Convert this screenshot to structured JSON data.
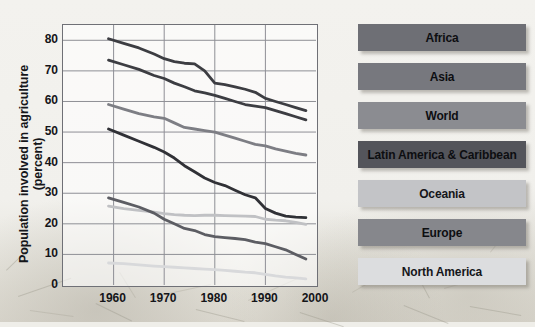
{
  "chart_data": {
    "type": "line",
    "title": "",
    "xlabel": "",
    "ylabel": "Population involved in agriculture (percent)",
    "xlim": [
      1950,
      2000
    ],
    "ylim": [
      0,
      85
    ],
    "yticks": [
      0,
      10,
      20,
      30,
      40,
      50,
      60,
      70,
      80
    ],
    "xticks": [
      1960,
      1970,
      1980,
      1990,
      2000
    ],
    "grid": true,
    "legend_position": "right",
    "x": [
      1959,
      1962,
      1965,
      1968,
      1970,
      1972,
      1974,
      1976,
      1978,
      1980,
      1982,
      1984,
      1986,
      1988,
      1990,
      1992,
      1994,
      1996,
      1998
    ],
    "series": [
      {
        "name": "Africa",
        "color": "#3c3d42",
        "values": [
          80.5,
          79.0,
          77.5,
          75.5,
          74.0,
          73.0,
          72.5,
          72.3,
          70.0,
          66.0,
          65.5,
          64.8,
          64.0,
          63.0,
          61.0,
          60.0,
          59.0,
          58.0,
          57.0
        ]
      },
      {
        "name": "Asia",
        "color": "#3c3d42",
        "values": [
          73.5,
          72.0,
          70.5,
          68.5,
          67.5,
          66.0,
          64.8,
          63.5,
          62.8,
          62.0,
          61.0,
          60.0,
          59.0,
          58.5,
          58.0,
          57.0,
          56.0,
          55.0,
          54.0
        ]
      },
      {
        "name": "World",
        "color": "#7d7e84",
        "values": [
          59.0,
          57.5,
          56.0,
          55.0,
          54.5,
          53.0,
          51.5,
          51.0,
          50.5,
          50.0,
          49.0,
          48.0,
          47.0,
          46.0,
          45.5,
          44.5,
          43.8,
          43.0,
          42.5
        ]
      },
      {
        "name": "Latin America & Caribbean",
        "color": "#303136",
        "values": [
          51.0,
          49.0,
          47.0,
          45.0,
          43.5,
          41.5,
          39.0,
          37.0,
          35.0,
          33.5,
          32.5,
          31.0,
          29.5,
          28.5,
          25.0,
          23.5,
          22.5,
          22.2,
          22.0
        ]
      },
      {
        "name": "Oceania",
        "color": "#c0c1c4",
        "values": [
          25.8,
          25.0,
          24.4,
          23.8,
          23.3,
          23.0,
          22.8,
          22.7,
          22.8,
          22.8,
          22.7,
          22.6,
          22.5,
          22.4,
          21.5,
          21.2,
          21.0,
          20.5,
          19.8
        ]
      },
      {
        "name": "Europe",
        "color": "#5c5d63",
        "values": [
          28.5,
          27.0,
          25.5,
          23.5,
          21.5,
          20.0,
          18.5,
          17.8,
          16.5,
          15.8,
          15.5,
          15.2,
          14.8,
          14.0,
          13.5,
          12.5,
          11.5,
          10.0,
          8.5
        ]
      },
      {
        "name": "North America",
        "color": "#d8d9db",
        "values": [
          7.2,
          7.0,
          6.6,
          6.2,
          6.0,
          5.8,
          5.6,
          5.4,
          5.2,
          5.0,
          4.8,
          4.5,
          4.2,
          4.0,
          3.5,
          3.0,
          2.6,
          2.3,
          2.0
        ]
      }
    ]
  },
  "legend": {
    "items": [
      {
        "label": "Africa",
        "swatch": "#6e6f75",
        "light": false
      },
      {
        "label": "Asia",
        "swatch": "#77787e",
        "light": false
      },
      {
        "label": "World",
        "swatch": "#8b8c91",
        "light": false
      },
      {
        "label": "Latin America & Caribbean",
        "swatch": "#54555b",
        "light": false
      },
      {
        "label": "Oceania",
        "swatch": "#c3c4c7",
        "light": true
      },
      {
        "label": "Europe",
        "swatch": "#86878c",
        "light": false
      },
      {
        "label": "North America",
        "swatch": "#dcdddf",
        "light": true
      }
    ]
  },
  "axis": {
    "y_title": "Population involved in agriculture (percent)",
    "y_tick_labels": [
      "80",
      "70",
      "60",
      "50",
      "40",
      "30",
      "20",
      "10",
      "0"
    ],
    "x_tick_labels": [
      "1960",
      "1970",
      "1980",
      "1990",
      "2000"
    ]
  }
}
